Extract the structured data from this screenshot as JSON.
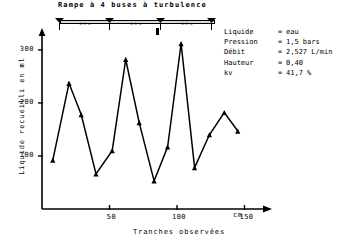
{
  "title": "Rampe à 4 buses à turbulence",
  "boom": {
    "nozzle_count": 4,
    "spacings": [
      "0.5 m",
      "0.5 m",
      "0.5 m"
    ],
    "nozzle_icon": "spray-nozzle-icon"
  },
  "params": [
    {
      "key": "Liquide",
      "eq": "=",
      "value": "eau"
    },
    {
      "key": "Pression",
      "eq": "=",
      "value": "1,5 bars"
    },
    {
      "key": "Débit",
      "eq": "=",
      "value": "2,527 L/min"
    },
    {
      "key": "Hauteur",
      "eq": "=",
      "value": "0,40"
    },
    {
      "key": "kv",
      "eq": "=",
      "value": "41,7 %"
    }
  ],
  "axes": {
    "x_unit": "cm",
    "x_title": "Tranches observées",
    "y_title": "Liquide recueilli en ml",
    "x_ticks": [
      "50",
      "100",
      "150"
    ],
    "y_ticks": [
      "100",
      "200",
      "300"
    ]
  },
  "chart_data": {
    "type": "line",
    "title": "Rampe à 4 buses à turbulence",
    "xlabel": "Tranches observées",
    "ylabel": "Liquide recueilli en ml",
    "xlim": [
      0,
      160
    ],
    "ylim": [
      0,
      330
    ],
    "xunit": "cm",
    "yunit": "ml",
    "grid": false,
    "legend": "none",
    "marker": "triangle",
    "x": [
      8,
      20,
      29,
      40,
      52,
      62,
      72,
      83,
      93,
      103,
      113,
      124,
      135,
      145
    ],
    "values": [
      92,
      237,
      178,
      66,
      110,
      282,
      163,
      53,
      117,
      312,
      78,
      140,
      182,
      147
    ],
    "annotations": [
      "Liquide = eau",
      "Pression = 1,5 bars",
      "Débit = 2,527 L/min",
      "Hauteur = 0,40",
      "kv = 41,7 %"
    ]
  }
}
